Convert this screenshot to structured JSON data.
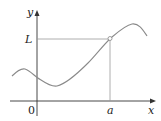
{
  "diagram": {
    "type": "function-graph",
    "axes": {
      "x_label": "x",
      "y_label": "y",
      "origin_label": "0"
    },
    "marks": {
      "x_value_label": "a",
      "y_value_label": "L"
    },
    "colors": {
      "curve": "#8a8a8a",
      "axes": "#333333",
      "guide_lines": "#9a9a9a",
      "point": "#888888"
    }
  }
}
